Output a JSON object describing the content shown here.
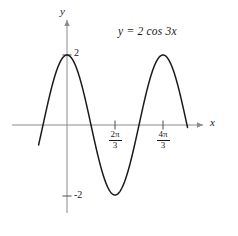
{
  "figure": {
    "background_color": "#ffffff",
    "curve_color": "#1a1a1a",
    "axis_color": "#8c8c8c",
    "text_color": "#1a1a1a"
  },
  "equation": {
    "text": "y = 2 cos 3x",
    "lhs": "y",
    "rhs_coefficient": "2",
    "rhs_function": "cos",
    "rhs_argument": "3x"
  },
  "axes": {
    "y_label": "y",
    "x_label": "x",
    "y_tick_labels": [
      "2",
      "-2"
    ],
    "x_tick_labels": [
      {
        "numerator": "2π",
        "denominator": "3"
      },
      {
        "numerator": "4π",
        "denominator": "3"
      }
    ]
  },
  "chart_data": {
    "type": "line",
    "title": "y = 2 cos 3x",
    "xlabel": "x",
    "ylabel": "y",
    "function": "y = 2*cos(3*x)",
    "amplitude": 2,
    "period": 2.0943951,
    "period_label": "2π/3",
    "frequency": 3,
    "grid": false,
    "legend": false,
    "xlim": [
      -0.62,
      2.63
    ],
    "ylim": [
      -2.2,
      2.2
    ],
    "xticks": [
      2.0943951,
      4.1887902
    ],
    "xtick_labels": [
      "2π/3",
      "4π/3"
    ],
    "yticks": [
      2,
      -2
    ],
    "ytick_labels": [
      "2",
      "-2"
    ],
    "maxima_x": [
      0,
      2.0943951,
      4.1887902
    ],
    "maxima_y": [
      2,
      2,
      2
    ],
    "minima_x": [
      1.0471976,
      3.1415927,
      5.2359878
    ],
    "minima_y": [
      -2,
      -2,
      -2
    ],
    "zeros_x": [
      0.5235988,
      1.5707963,
      2.6179939,
      3.6651914,
      4.712389
    ],
    "x": [
      -0.62,
      -0.55,
      -0.48,
      -0.41,
      -0.34,
      -0.27,
      -0.2,
      -0.13,
      -0.06,
      0.0,
      0.07,
      0.14,
      0.21,
      0.28,
      0.35,
      0.42,
      0.49,
      0.56,
      0.63,
      0.7,
      0.77,
      0.84,
      0.91,
      0.98,
      1.05,
      1.12,
      1.19,
      1.26,
      1.33,
      1.4,
      1.47,
      1.54,
      1.61,
      1.68,
      1.75,
      1.82,
      1.89,
      1.96,
      2.03,
      2.1,
      2.17,
      2.24,
      2.31,
      2.38,
      2.45,
      2.52,
      2.59,
      2.63
    ],
    "y": [
      -1.26,
      -1.66,
      -1.92,
      -2.0,
      -1.9,
      -1.62,
      -1.19,
      -0.65,
      -0.06,
      2.0,
      1.91,
      1.65,
      1.23,
      0.71,
      0.13,
      -0.46,
      -1.0,
      -1.45,
      -1.76,
      -1.95,
      -2.0,
      -1.88,
      -1.6,
      -1.2,
      -0.7,
      -0.11,
      0.48,
      1.02,
      1.47,
      1.78,
      1.95,
      1.99,
      1.86,
      1.57,
      1.16,
      0.65,
      0.06,
      -0.53,
      -1.07,
      -1.5,
      -1.8,
      -1.96,
      -1.99,
      -1.84,
      -1.54,
      -1.12,
      -0.6,
      -0.3
    ]
  }
}
